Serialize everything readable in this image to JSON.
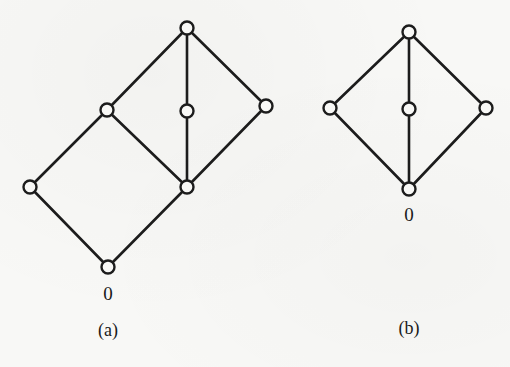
{
  "figure": {
    "panels": [
      {
        "id": "a",
        "caption": "(a)",
        "bottom_label": "0",
        "nodes": [
          {
            "name": "top",
            "x": 187,
            "y": 28
          },
          {
            "name": "left-mid",
            "x": 107,
            "y": 110
          },
          {
            "name": "center",
            "x": 187,
            "y": 111
          },
          {
            "name": "right",
            "x": 266,
            "y": 106
          },
          {
            "name": "far-left",
            "x": 30,
            "y": 187
          },
          {
            "name": "lower-right",
            "x": 187,
            "y": 187
          },
          {
            "name": "bottom",
            "x": 108,
            "y": 267
          }
        ],
        "edges": [
          [
            "top",
            "left-mid"
          ],
          [
            "top",
            "center"
          ],
          [
            "top",
            "right"
          ],
          [
            "left-mid",
            "far-left"
          ],
          [
            "left-mid",
            "lower-right"
          ],
          [
            "center",
            "lower-right"
          ],
          [
            "right",
            "lower-right"
          ],
          [
            "far-left",
            "bottom"
          ],
          [
            "lower-right",
            "bottom"
          ]
        ]
      },
      {
        "id": "b",
        "caption": "(b)",
        "bottom_label": "0",
        "nodes": [
          {
            "name": "top",
            "x": 409,
            "y": 32
          },
          {
            "name": "left",
            "x": 330,
            "y": 108
          },
          {
            "name": "center",
            "x": 409,
            "y": 109
          },
          {
            "name": "right",
            "x": 486,
            "y": 108
          },
          {
            "name": "bottom",
            "x": 409,
            "y": 189
          }
        ],
        "edges": [
          [
            "top",
            "left"
          ],
          [
            "top",
            "center"
          ],
          [
            "top",
            "right"
          ],
          [
            "left",
            "bottom"
          ],
          [
            "center",
            "bottom"
          ],
          [
            "right",
            "bottom"
          ]
        ]
      }
    ],
    "colors": {
      "ink": "#1c1c1c",
      "paper": "#f8f8f6"
    }
  }
}
